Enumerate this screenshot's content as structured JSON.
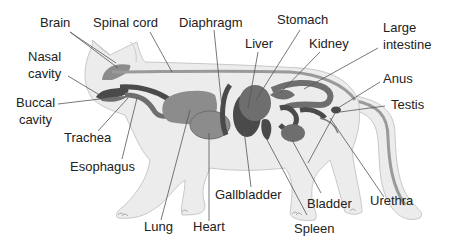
{
  "diagram": {
    "colors": {
      "body_fill": "#ececec",
      "body_stroke": "#c8c8c8",
      "organ_light": "#8c8c8c",
      "organ_mid": "#6e6e6e",
      "organ_dark": "#4a4a4a",
      "spine": "#9a9a9a",
      "leader_line": "#555555",
      "text": "#222222"
    },
    "labels": {
      "brain": "Brain",
      "spinal_cord": "Spinal cord",
      "diaphragm": "Diaphragm",
      "stomach": "Stomach",
      "liver": "Liver",
      "kidney": "Kidney",
      "large_intestine_1": "Large",
      "large_intestine_2": "intestine",
      "nasal_cavity_1": "Nasal",
      "nasal_cavity_2": "cavity",
      "anus": "Anus",
      "buccal_cavity_1": "Buccal",
      "buccal_cavity_2": "cavity",
      "testis": "Testis",
      "trachea": "Trachea",
      "esophagus": "Esophagus",
      "gallbladder": "Gallbladder",
      "bladder": "Bladder",
      "urethra": "Urethra",
      "lung": "Lung",
      "heart": "Heart",
      "spleen": "Spleen"
    }
  }
}
